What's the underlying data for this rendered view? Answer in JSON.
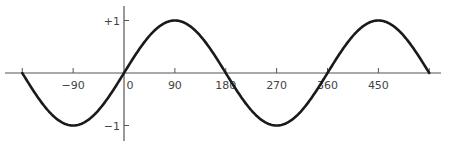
{
  "chart_data": {
    "type": "line",
    "title": "",
    "xlabel": "",
    "ylabel": "",
    "function": "sin(x)",
    "xlim": [
      -180,
      540
    ],
    "ylim": [
      -1,
      1
    ],
    "grid": false,
    "x_ticks": [
      {
        "value": -90,
        "label": "-90"
      },
      {
        "value": 0,
        "label": "0"
      },
      {
        "value": 90,
        "label": "90"
      },
      {
        "value": 180,
        "label": "180"
      },
      {
        "value": 270,
        "label": "270"
      },
      {
        "value": 360,
        "label": "360"
      },
      {
        "value": 450,
        "label": "450"
      }
    ],
    "y_ticks": [
      {
        "value": 1,
        "label": "+1"
      },
      {
        "value": -1,
        "label": "-1"
      }
    ],
    "series": [
      {
        "name": "sin",
        "x": [
          -180,
          -90,
          0,
          90,
          180,
          270,
          360,
          450,
          540
        ],
        "values": [
          0,
          -1,
          0,
          1,
          0,
          -1,
          0,
          1,
          0
        ]
      }
    ],
    "colors": {
      "curve": "#1a1a1a",
      "axis": "#555555"
    }
  }
}
